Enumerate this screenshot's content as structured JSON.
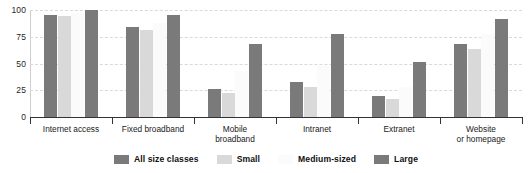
{
  "chart_data": {
    "type": "bar",
    "title": "",
    "xlabel": "",
    "ylabel": "",
    "ylim": [
      0,
      100
    ],
    "yticks": [
      0,
      25,
      50,
      75,
      100
    ],
    "grid": true,
    "legend_position": "bottom",
    "categories": [
      "Internet access",
      "Fixed broadband",
      "Mobile\nbroadband",
      "Intranet",
      "Extranet",
      "Website\nor homepage"
    ],
    "series": [
      {
        "name": "All size classes",
        "color": "#7a7a7a",
        "values": [
          95,
          84,
          26,
          33,
          20,
          68
        ]
      },
      {
        "name": "Small",
        "color": "#d9d9d9",
        "values": [
          94,
          81,
          22,
          28,
          17,
          64
        ]
      },
      {
        "name": "Medium-sized",
        "color": "#fbfbfb",
        "values": [
          97,
          88,
          43,
          48,
          28,
          78
        ]
      },
      {
        "name": "Large",
        "color": "#7a7a7a",
        "values": [
          100,
          95,
          68,
          78,
          51,
          92
        ]
      }
    ]
  },
  "axis": {
    "tick_labels": [
      "100",
      "75",
      "50",
      "25",
      "0"
    ]
  },
  "colors": {
    "dark_gray": "#7a7a7a",
    "light_gray": "#d9d9d9",
    "near_white": "#fbfbfb",
    "gridline": "#d9d9d9",
    "axis": "#333333",
    "text": "#1a1a1a",
    "background": "#ffffff"
  }
}
